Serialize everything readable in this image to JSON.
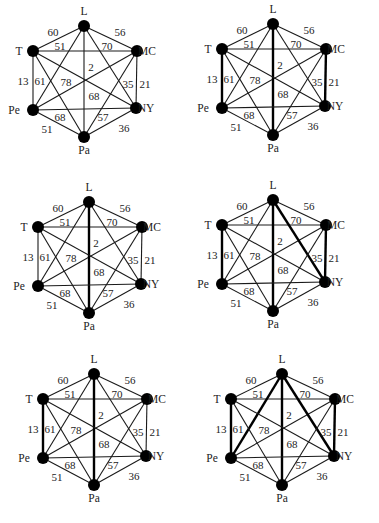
{
  "figure": {
    "vertices": [
      "L",
      "T",
      "MC",
      "Pe",
      "NY",
      "Pa"
    ],
    "edges": [
      {
        "id": "L-T",
        "from": "L",
        "to": "T",
        "weight": "60"
      },
      {
        "id": "L-MC",
        "from": "L",
        "to": "MC",
        "weight": "56"
      },
      {
        "id": "T-MC",
        "from": "T",
        "to": "MC",
        "weight": "51"
      },
      {
        "id": "MC-Pe",
        "from": "MC",
        "to": "Pe",
        "weight": "70"
      },
      {
        "id": "L-Pa",
        "from": "L",
        "to": "Pa",
        "weight": "2"
      },
      {
        "id": "T-Pe",
        "from": "T",
        "to": "Pe",
        "weight": "13"
      },
      {
        "id": "L-Pe",
        "from": "L",
        "to": "Pe",
        "weight": "61"
      },
      {
        "id": "T-NY",
        "from": "T",
        "to": "NY",
        "weight": "78"
      },
      {
        "id": "L-NY",
        "from": "L",
        "to": "NY",
        "weight": "35"
      },
      {
        "id": "MC-NY",
        "from": "MC",
        "to": "NY",
        "weight": "21"
      },
      {
        "id": "T-Pa",
        "from": "T",
        "to": "Pa",
        "weight": "68"
      },
      {
        "id": "Pe-NY",
        "from": "Pe",
        "to": "NY",
        "weight": "68"
      },
      {
        "id": "MC-Pa",
        "from": "MC",
        "to": "Pa",
        "weight": "57"
      },
      {
        "id": "Pe-Pa",
        "from": "Pe",
        "to": "Pa",
        "weight": "51"
      },
      {
        "id": "NY-Pa",
        "from": "NY",
        "to": "Pa",
        "weight": "36"
      }
    ],
    "panels": [
      {
        "id": "panel-1",
        "offset": [
          0,
          0
        ],
        "bold_edges": []
      },
      {
        "id": "panel-2",
        "offset": [
          189,
          -2
        ],
        "bold_edges": [
          "T-Pe",
          "L-Pa",
          "MC-NY"
        ]
      },
      {
        "id": "panel-3",
        "offset": [
          5,
          176
        ],
        "bold_edges": [
          "L-Pa"
        ]
      },
      {
        "id": "panel-4",
        "offset": [
          189,
          174
        ],
        "bold_edges": [
          "T-Pe",
          "L-Pa",
          "MC-NY",
          "L-NY"
        ]
      },
      {
        "id": "panel-5",
        "offset": [
          10,
          348
        ],
        "bold_edges": [
          "L-Pa",
          "T-Pe"
        ]
      },
      {
        "id": "panel-6",
        "offset": [
          198,
          348
        ],
        "bold_edges": [
          "T-Pe",
          "L-Pa",
          "MC-NY",
          "L-NY",
          "L-Pe"
        ]
      }
    ],
    "base_positions": {
      "L": [
        84,
        26
      ],
      "T": [
        33,
        51
      ],
      "MC": [
        137,
        51
      ],
      "Pe": [
        33,
        110
      ],
      "NY": [
        136,
        108
      ],
      "Pa": [
        84,
        137
      ]
    },
    "vertex_label_positions": {
      "L": [
        84,
        15
      ],
      "T": [
        19,
        55
      ],
      "MC": [
        147,
        55
      ],
      "Pe": [
        14,
        114
      ],
      "NY": [
        146,
        112
      ],
      "Pa": [
        84,
        154
      ]
    },
    "weight_label_positions": [
      {
        "text": "60",
        "x": 53,
        "y": 36
      },
      {
        "text": "51",
        "x": 60,
        "y": 50
      },
      {
        "text": "56",
        "x": 120,
        "y": 36
      },
      {
        "text": "70",
        "x": 107,
        "y": 50
      },
      {
        "text": "2",
        "x": 91,
        "y": 71
      },
      {
        "text": "13",
        "x": 23,
        "y": 85
      },
      {
        "text": "61",
        "x": 40,
        "y": 85
      },
      {
        "text": "78",
        "x": 66,
        "y": 86
      },
      {
        "text": "35",
        "x": 128,
        "y": 88
      },
      {
        "text": "21",
        "x": 145,
        "y": 88
      },
      {
        "text": "68",
        "x": 94,
        "y": 100
      },
      {
        "text": "68",
        "x": 60,
        "y": 121
      },
      {
        "text": "57",
        "x": 103,
        "y": 121
      },
      {
        "text": "51",
        "x": 47,
        "y": 133
      },
      {
        "text": "36",
        "x": 124,
        "y": 132
      }
    ]
  }
}
